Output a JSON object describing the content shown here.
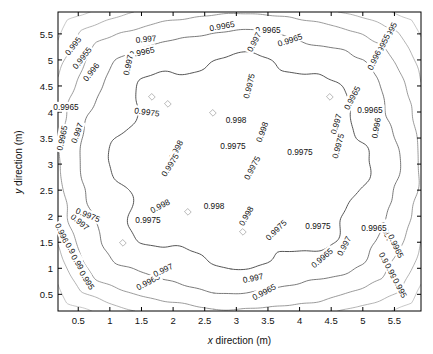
{
  "figure": {
    "background": "#ffffff",
    "axes_color": "#000000"
  },
  "axes": {
    "x_label_prefix": "x",
    "x_label_suffix": " direction (m)",
    "y_label_prefix": "y",
    "y_label_suffix": " direction (m)",
    "x_ticks": [
      "0.5",
      "1",
      "1.5",
      "2",
      "2.5",
      "3",
      "3.5",
      "4",
      "4.5",
      "5",
      "5.5"
    ],
    "y_ticks": [
      "0.5",
      "1",
      "1.5",
      "2",
      "2.5",
      "3",
      "3.5",
      "4",
      "4.5",
      "5",
      "5.5"
    ]
  },
  "chart_data": {
    "type": "contour",
    "title": "",
    "xlabel": "x direction (m)",
    "ylabel": "y direction (m)",
    "xlim": [
      0.18,
      5.92
    ],
    "ylim": [
      0.18,
      5.92
    ],
    "x_ticks": [
      0.5,
      1,
      1.5,
      2,
      2.5,
      3,
      3.5,
      4,
      4.5,
      5,
      5.5
    ],
    "y_ticks": [
      0.5,
      1,
      1.5,
      2,
      2.5,
      3,
      3.5,
      4,
      4.5,
      5,
      5.5
    ],
    "grid": false,
    "legend": null,
    "colorbar": false,
    "levels": [
      0.995,
      0.9955,
      0.996,
      0.9965,
      0.997,
      0.9975,
      0.998
    ],
    "level_labels": [
      "0.995",
      "0.9955",
      "0.996",
      "0.9965",
      "0.997",
      "0.9975",
      "0.998"
    ],
    "level_colors": [
      "#c9c9c9",
      "#bdbdbd",
      "#ababab",
      "#949494",
      "#7d7d7d",
      "#5e5e5e",
      "#3d3d3d"
    ],
    "field_max_note": "centre region exceeds 0.998 (unlabelled)",
    "field_min_note": "corners fall below 0.995",
    "inline_labels": [
      {
        "text": "0.995",
        "x": 73,
        "y": 46,
        "rot": 52
      },
      {
        "text": "0.9955",
        "x": 82,
        "y": 58,
        "rot": 52
      },
      {
        "text": "0.996",
        "x": 91,
        "y": 72,
        "rot": 52
      },
      {
        "text": "0.9965",
        "x": 66,
        "y": 107,
        "rot": 0
      },
      {
        "text": "0.9965",
        "x": 62,
        "y": 138,
        "rot": 78
      },
      {
        "text": "0.997",
        "x": 77,
        "y": 133,
        "rot": 70
      },
      {
        "text": "0.9965",
        "x": 63,
        "y": 235,
        "rot": -64
      },
      {
        "text": "0.997",
        "x": 80,
        "y": 222,
        "rot": -40
      },
      {
        "text": "0.9975",
        "x": 88,
        "y": 215,
        "rot": -22
      },
      {
        "text": "0.996",
        "x": 73,
        "y": 252,
        "rot": -58
      },
      {
        "text": "0.9955",
        "x": 80,
        "y": 266,
        "rot": -58
      },
      {
        "text": "0.995",
        "x": 87,
        "y": 280,
        "rot": -58
      },
      {
        "text": "0.997",
        "x": 146,
        "y": 39,
        "rot": 6
      },
      {
        "text": "0.9965",
        "x": 142,
        "y": 52,
        "rot": 12
      },
      {
        "text": "0.997",
        "x": 128,
        "y": 65,
        "rot": 78
      },
      {
        "text": "0.9975",
        "x": 147,
        "y": 112,
        "rot": -8
      },
      {
        "text": "0.998",
        "x": 176,
        "y": 150,
        "rot": 62
      },
      {
        "text": "0.9975",
        "x": 170,
        "y": 165,
        "rot": 58
      },
      {
        "text": "0.998",
        "x": 160,
        "y": 206,
        "rot": 28
      },
      {
        "text": "0.9975",
        "x": 148,
        "y": 220,
        "rot": 0
      },
      {
        "text": "0.9965",
        "x": 148,
        "y": 282,
        "rot": 28
      },
      {
        "text": "0.997",
        "x": 163,
        "y": 270,
        "rot": 26
      },
      {
        "text": "0.9965",
        "x": 222,
        "y": 26,
        "rot": 10
      },
      {
        "text": "0.9965",
        "x": 268,
        "y": 30,
        "rot": 0
      },
      {
        "text": "0.997",
        "x": 254,
        "y": 42,
        "rot": 62
      },
      {
        "text": "0.9965",
        "x": 290,
        "y": 40,
        "rot": 18
      },
      {
        "text": "0.9975",
        "x": 249,
        "y": 86,
        "rot": 76
      },
      {
        "text": "0.998",
        "x": 236,
        "y": 120,
        "rot": 0
      },
      {
        "text": "0.998",
        "x": 262,
        "y": 132,
        "rot": 70
      },
      {
        "text": "0.9975",
        "x": 233,
        "y": 146,
        "rot": 0
      },
      {
        "text": "0.998",
        "x": 214,
        "y": 206,
        "rot": 0
      },
      {
        "text": "0.9975",
        "x": 252,
        "y": 168,
        "rot": 62
      },
      {
        "text": "0.998",
        "x": 246,
        "y": 216,
        "rot": 60
      },
      {
        "text": "0.9975",
        "x": 276,
        "y": 230,
        "rot": 44
      },
      {
        "text": "0.997",
        "x": 253,
        "y": 278,
        "rot": 12
      },
      {
        "text": "0.9965",
        "x": 264,
        "y": 292,
        "rot": 28
      },
      {
        "text": "0.9975",
        "x": 300,
        "y": 152,
        "rot": 0
      },
      {
        "text": "0.9975",
        "x": 318,
        "y": 226,
        "rot": 0
      },
      {
        "text": "0.9965",
        "x": 322,
        "y": 258,
        "rot": 40
      },
      {
        "text": "0.997",
        "x": 344,
        "y": 246,
        "rot": 62
      },
      {
        "text": "0.997",
        "x": 336,
        "y": 124,
        "rot": 74
      },
      {
        "text": "0.9975",
        "x": 338,
        "y": 146,
        "rot": 74
      },
      {
        "text": "0.9965",
        "x": 352,
        "y": 98,
        "rot": 62
      },
      {
        "text": "0.9965",
        "x": 370,
        "y": 110,
        "rot": 0
      },
      {
        "text": "0.995",
        "x": 390,
        "y": 32,
        "rot": 64
      },
      {
        "text": "0.9955",
        "x": 382,
        "y": 46,
        "rot": 64
      },
      {
        "text": "0.996",
        "x": 374,
        "y": 60,
        "rot": 64
      },
      {
        "text": "0.996",
        "x": 376,
        "y": 128,
        "rot": 80
      },
      {
        "text": "0.997",
        "x": 386,
        "y": 232,
        "rot": -64
      },
      {
        "text": "0.9965",
        "x": 396,
        "y": 246,
        "rot": -64
      },
      {
        "text": "0.9965",
        "x": 374,
        "y": 228,
        "rot": 0
      },
      {
        "text": "0.996",
        "x": 386,
        "y": 262,
        "rot": -62
      },
      {
        "text": "0.9955",
        "x": 393,
        "y": 275,
        "rot": -62
      },
      {
        "text": "0.995",
        "x": 400,
        "y": 288,
        "rot": -62
      }
    ]
  }
}
